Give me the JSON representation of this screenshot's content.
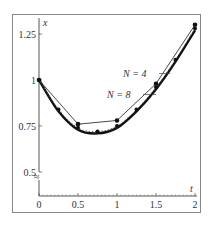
{
  "chart_data": {
    "type": "line",
    "title": "",
    "xlabel": "t",
    "ylabel": "x",
    "xlim": [
      0,
      2
    ],
    "ylim": [
      0.45,
      1.32
    ],
    "x_ticks": [
      "0",
      "0.5",
      "1",
      "1.5",
      "2"
    ],
    "y_ticks": [
      "0.5",
      "0.75",
      "1",
      "1.25"
    ],
    "y_axis_break": true,
    "grid": false,
    "series": [
      {
        "name": "exact",
        "style": "thick solid",
        "x": [
          0,
          0.25,
          0.5,
          0.75,
          1.0,
          1.25,
          1.5,
          1.75,
          2.0
        ],
        "y": [
          1.0,
          0.83,
          0.73,
          0.71,
          0.74,
          0.83,
          0.95,
          1.1,
          1.27
        ]
      },
      {
        "name": "N = 4",
        "style": "thin solid with dots",
        "x": [
          0,
          0.5,
          1.0,
          1.5,
          2.0
        ],
        "y": [
          1.0,
          0.76,
          0.78,
          0.98,
          1.3
        ]
      },
      {
        "name": "N = 8",
        "style": "dotted with dots",
        "x": [
          0,
          0.25,
          0.5,
          0.75,
          1.0,
          1.25,
          1.5,
          1.75,
          2.0
        ],
        "y": [
          1.0,
          0.84,
          0.74,
          0.72,
          0.75,
          0.84,
          0.96,
          1.11,
          1.28
        ]
      }
    ],
    "annotations": [
      {
        "text": "N = 4",
        "target_series": "N = 4"
      },
      {
        "text": "N = 8",
        "target_series": "N = 8"
      }
    ]
  },
  "labels": {
    "x_axis": "t",
    "y_axis": "x",
    "n4": "N = 4",
    "n8": "N = 8",
    "break_mark": "≈"
  }
}
